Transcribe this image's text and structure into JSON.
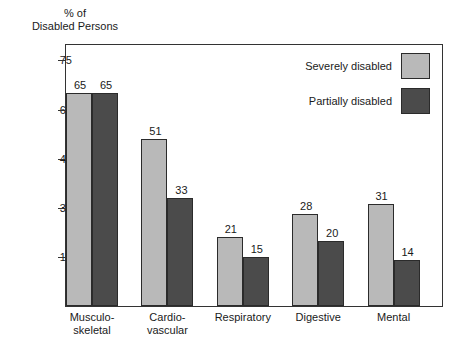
{
  "chart_data": {
    "type": "bar",
    "title": "",
    "ylabel": "% of\nDisabled Persons",
    "xlabel": "",
    "ylim": [
      0,
      80
    ],
    "yticks": [
      15,
      30,
      45,
      60,
      75
    ],
    "ytick_labels": [
      "15",
      "30",
      "45",
      "60",
      "75"
    ],
    "grid": false,
    "legend_position": "top-right",
    "categories": [
      "Musculo-\nskeletal",
      "Cardio-\nvascular",
      "Respiratory",
      "Digestive",
      "Mental"
    ],
    "series": [
      {
        "name": "Severely disabled",
        "color": "#b9b9b9",
        "values": [
          65,
          51,
          21,
          28,
          31
        ],
        "value_labels": [
          "65",
          "51",
          "21",
          "28",
          "31"
        ]
      },
      {
        "name": "Partially disabled",
        "color": "#4b4b4b",
        "values": [
          65,
          33,
          15,
          20,
          14
        ],
        "value_labels": [
          "65",
          "33",
          "15",
          "20",
          "14"
        ]
      }
    ]
  },
  "legend": {
    "items": [
      {
        "label": "Severely disabled",
        "color": "#b9b9b9"
      },
      {
        "label": "Partially disabled",
        "color": "#4b4b4b"
      }
    ]
  },
  "colors": {
    "severely_disabled": "#b9b9b9",
    "partially_disabled": "#4b4b4b",
    "axis": "#333333",
    "text": "#1a1a1a",
    "background": "#ffffff"
  }
}
